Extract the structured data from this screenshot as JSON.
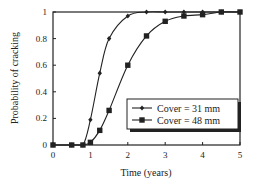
{
  "chart_data": {
    "type": "line",
    "title": "",
    "xlabel": "Time (years)",
    "ylabel": "Probability of cracking",
    "xlim": [
      0,
      5
    ],
    "ylim": [
      0,
      1
    ],
    "xticks": [
      "0",
      "1",
      "2",
      "3",
      "4",
      "5"
    ],
    "yticks": [
      "0",
      "0.2",
      "0.4",
      "0.6",
      "0.8",
      "1"
    ],
    "grid": false,
    "legend_position": "lower right",
    "series": [
      {
        "name": "Cover = 31 mm",
        "marker": "diamond",
        "x": [
          0,
          0.5,
          0.8,
          1.0,
          1.25,
          1.5,
          2.0,
          2.5,
          3.0,
          3.5,
          4.0,
          4.5,
          5.0
        ],
        "values": [
          0,
          0,
          0,
          0.19,
          0.54,
          0.8,
          0.97,
          1,
          1,
          1,
          1,
          1,
          1
        ]
      },
      {
        "name": "Cover = 48 mm",
        "marker": "square",
        "x": [
          0,
          0.5,
          0.8,
          1.0,
          1.25,
          1.5,
          2.0,
          2.5,
          3.0,
          3.5,
          4.0,
          4.5,
          5.0
        ],
        "values": [
          0,
          0,
          0,
          0.02,
          0.11,
          0.26,
          0.6,
          0.82,
          0.93,
          0.97,
          0.98,
          1,
          1
        ]
      }
    ]
  }
}
